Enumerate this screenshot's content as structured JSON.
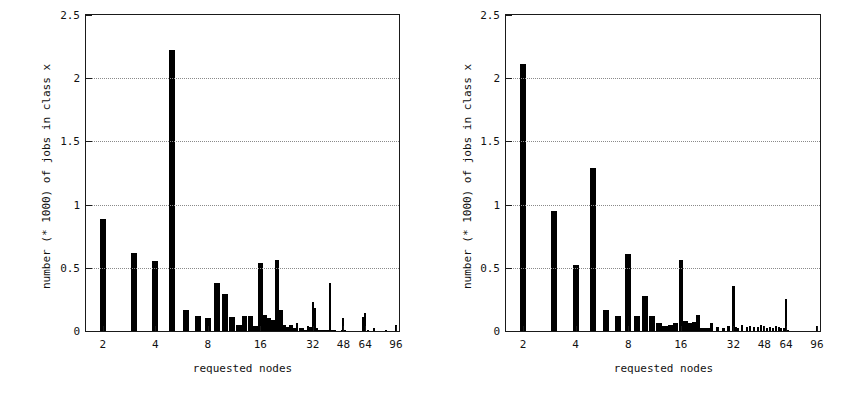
{
  "figure": {
    "background_color": "#ffffff",
    "bar_color": "#000000",
    "axis_color": "#1a1a1a",
    "grid_color": "#8a8a8a"
  },
  "panels": [
    {
      "id": "left",
      "name": "left-histogram"
    },
    {
      "id": "right",
      "name": "right-histogram"
    }
  ],
  "chart_data": [
    {
      "type": "bar",
      "panel": "left",
      "title": "",
      "xlabel": "requested nodes",
      "ylabel": "number (* 1000) of jobs in class x",
      "xscale": "log",
      "xlim": [
        1.6,
        100
      ],
      "ylim": [
        0,
        2.5
      ],
      "grid": true,
      "grid_y": [
        0.5,
        1.0,
        1.5,
        2.0
      ],
      "ytick_labels": [
        "0",
        "0.5",
        "1",
        "1.5",
        "2",
        "2.5"
      ],
      "ytick_values": [
        0,
        0.5,
        1,
        1.5,
        2,
        2.5
      ],
      "xtick_labels": [
        "2",
        "4",
        "8",
        "16",
        "32",
        "48",
        "64",
        "96"
      ],
      "xtick_values": [
        2,
        4,
        8,
        16,
        32,
        48,
        64,
        96
      ],
      "x": [
        2,
        3,
        4,
        5,
        6,
        7,
        8,
        9,
        10,
        11,
        12,
        13,
        14,
        15,
        16,
        17,
        18,
        19,
        20,
        21,
        22,
        23,
        24,
        25,
        26,
        27,
        28,
        29,
        30,
        31,
        32,
        33,
        34,
        35,
        36,
        37,
        38,
        39,
        40,
        41,
        42,
        43,
        44,
        45,
        46,
        47,
        48,
        49,
        50,
        52,
        54,
        56,
        58,
        60,
        62,
        64,
        66,
        68,
        72,
        76,
        80,
        84,
        88,
        92,
        96
      ],
      "values": [
        0.89,
        0.62,
        0.55,
        2.22,
        0.17,
        0.12,
        0.1,
        0.38,
        0.29,
        0.11,
        0.05,
        0.12,
        0.12,
        0.04,
        0.54,
        0.13,
        0.1,
        0.09,
        0.56,
        0.17,
        0.05,
        0.03,
        0.05,
        0.02,
        0.06,
        0.02,
        0.02,
        0.01,
        0.04,
        0.03,
        0.23,
        0.18,
        0.02,
        0.01,
        0.01,
        0.01,
        0.01,
        0.01,
        0.38,
        0.01,
        0.01,
        0.01,
        0.0,
        0.0,
        0.0,
        0.01,
        0.1,
        0.01,
        0.0,
        0.0,
        0.0,
        0.0,
        0.0,
        0.0,
        0.11,
        0.14,
        0.01,
        0.0,
        0.02,
        0.0,
        0.0,
        0.01,
        0.0,
        0.0,
        0.05
      ]
    },
    {
      "type": "bar",
      "panel": "right",
      "title": "",
      "xlabel": "requested nodes",
      "ylabel": "number (* 1000) of jobs in class x",
      "xscale": "log",
      "xlim": [
        1.6,
        100
      ],
      "ylim": [
        0,
        2.5
      ],
      "grid": true,
      "grid_y": [
        0.5,
        1.0,
        1.5,
        2.0
      ],
      "ytick_labels": [
        "0",
        "0.5",
        "1",
        "1.5",
        "2",
        "2.5"
      ],
      "ytick_values": [
        0,
        0.5,
        1,
        1.5,
        2,
        2.5
      ],
      "xtick_labels": [
        "2",
        "4",
        "8",
        "16",
        "32",
        "48",
        "64",
        "96"
      ],
      "xtick_values": [
        2,
        4,
        8,
        16,
        32,
        48,
        64,
        96
      ],
      "x": [
        2,
        3,
        4,
        5,
        6,
        7,
        8,
        9,
        10,
        11,
        12,
        13,
        14,
        15,
        16,
        17,
        18,
        19,
        20,
        21,
        22,
        23,
        24,
        26,
        28,
        30,
        32,
        33,
        34,
        36,
        38,
        40,
        42,
        44,
        46,
        48,
        50,
        52,
        54,
        56,
        58,
        60,
        62,
        64,
        66,
        68,
        72,
        76,
        80,
        84,
        88,
        92,
        96
      ],
      "values": [
        2.11,
        0.95,
        0.52,
        1.29,
        0.17,
        0.12,
        0.61,
        0.12,
        0.28,
        0.12,
        0.06,
        0.04,
        0.05,
        0.06,
        0.56,
        0.08,
        0.06,
        0.07,
        0.13,
        0.02,
        0.02,
        0.02,
        0.06,
        0.03,
        0.02,
        0.04,
        0.36,
        0.03,
        0.02,
        0.05,
        0.03,
        0.04,
        0.03,
        0.03,
        0.05,
        0.04,
        0.02,
        0.03,
        0.02,
        0.04,
        0.03,
        0.02,
        0.02,
        0.25,
        0.01,
        0.0,
        0.0,
        0.0,
        0.0,
        0.0,
        0.0,
        0.0,
        0.04
      ]
    }
  ]
}
